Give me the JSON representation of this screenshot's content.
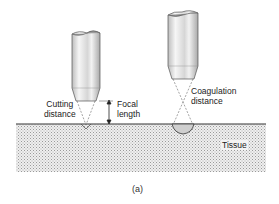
{
  "figure": {
    "caption": "(a)",
    "labels": {
      "cutting_distance": [
        "Cutting",
        "distance"
      ],
      "focal_length": [
        "Focal",
        "length"
      ],
      "coagulation_distance": [
        "Coagulation",
        "distance"
      ],
      "tissue": "Tissue"
    },
    "colors": {
      "line": "#333333",
      "tissue_fill": "#e4e4e4",
      "probe_body": "#dddddd",
      "probe_highlight": "#f4f4f4"
    }
  }
}
